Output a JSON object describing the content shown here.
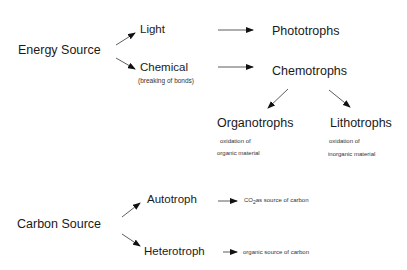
{
  "energy": {
    "title": "Energy Source",
    "light": "Light",
    "chemical": "Chemical",
    "chemical_note": "(breaking of bonds)",
    "phototrophs": "Phototrophs",
    "chemotrophs": "Chemotrophs",
    "organotrophs": {
      "label": "Organotrophs",
      "note_line1": "oxidation of",
      "note_line2": "organic material"
    },
    "lithotrophs": {
      "label": "Lithotrophs",
      "note_line1": "oxidation of",
      "note_line2": "inorganic material"
    }
  },
  "carbon": {
    "title": "Carbon Source",
    "autotroph": "Autotroph",
    "heterotroph": "Heterotroph",
    "autotroph_note_co": "CO",
    "autotroph_note_sub": "2",
    "autotroph_note_rest": "as source of carbon",
    "heterotroph_note": "organic source of carbon"
  },
  "colors": {
    "text": "#1a1a1a",
    "arrow": "#111111",
    "background": "#ffffff"
  }
}
